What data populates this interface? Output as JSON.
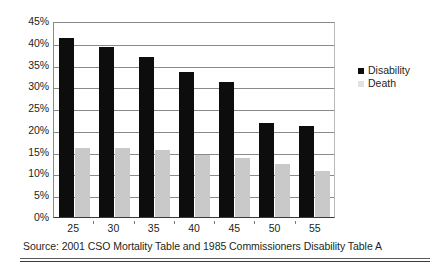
{
  "chart_data": {
    "type": "bar",
    "title": "",
    "xlabel": "",
    "ylabel": "",
    "categories": [
      "25",
      "30",
      "35",
      "40",
      "45",
      "50",
      "55"
    ],
    "series": [
      {
        "name": "Disability",
        "color": "#0d0d0d",
        "values": [
          41.0,
          39.0,
          36.7,
          33.2,
          31.0,
          21.5,
          20.8
        ]
      },
      {
        "name": "Death",
        "color": "#c9c9c9",
        "values": [
          15.9,
          15.8,
          15.3,
          14.2,
          13.5,
          12.2,
          10.6
        ]
      }
    ],
    "ylim": [
      0,
      45
    ],
    "yticks": [
      "0%",
      "5%",
      "10%",
      "15%",
      "20%",
      "25%",
      "30%",
      "35%",
      "40%",
      "45%"
    ],
    "ytick_values": [
      0,
      5,
      10,
      15,
      20,
      25,
      30,
      35,
      40,
      45
    ],
    "grid": true,
    "legend_position": "right",
    "legend": [
      "Disability",
      "Death"
    ]
  },
  "legend": {
    "items": [
      {
        "label": "Disability",
        "marker": "filled-square-icon"
      },
      {
        "label": "Death",
        "marker": "filled-square-icon"
      }
    ]
  },
  "footer": {
    "source": "Source: 2001 CSO Mortality Table and 1985 Commissioners Disability Table A"
  }
}
